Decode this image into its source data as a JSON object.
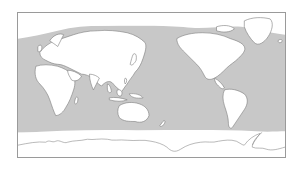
{
  "map": {
    "projection": "equirectangular, Pacific-centered",
    "colors": {
      "ocean": "#c8c8c8",
      "land": "#ffffff",
      "coastline": "#7a7a7a",
      "sea_ice": "#ffffff",
      "frame": "#9a9a9a",
      "background": "#ffffff"
    },
    "regions": [
      "Europe",
      "Asia",
      "Africa",
      "Australia",
      "North America",
      "Greenland",
      "South America",
      "New Zealand",
      "Antarctica",
      "Arctic sea ice",
      "Southern sea ice"
    ]
  }
}
